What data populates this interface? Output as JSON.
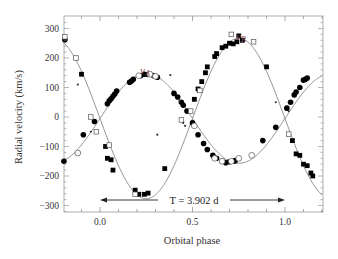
{
  "chart_data": {
    "type": "scatter",
    "title": "",
    "xlabel": "Orbital phase",
    "ylabel": "Radial velocity (km/s)",
    "xlim": [
      -0.195,
      1.2
    ],
    "ylim": [
      -320,
      330
    ],
    "xticks": [
      0.0,
      0.5,
      1.0
    ],
    "xtick_labels": [
      "0.0",
      "0.5",
      "1.0"
    ],
    "yticks": [
      300,
      200,
      100,
      0,
      -100,
      -200,
      -300
    ],
    "ytick_labels": [
      "300",
      "200",
      "100",
      "0",
      "−100",
      "−200",
      "−300"
    ],
    "grid": false,
    "legend": null,
    "annotations": [
      {
        "text": "v_A",
        "x": 0.25,
        "y": 165
      },
      {
        "text": "v_B",
        "x": 0.68,
        "y": 290
      },
      {
        "text": "T = 3.902 d",
        "type": "double-arrow",
        "x_from": 0.0,
        "x_to": 1.0,
        "y": -280
      }
    ],
    "model_curves": [
      {
        "name": "v_A",
        "gamma": -5,
        "K": 152,
        "phase_of_max": 0.25,
        "style": "solid gray line"
      },
      {
        "name": "v_B",
        "gamma": -5,
        "K": 272,
        "phase_of_max": 0.75,
        "style": "solid gray line"
      }
    ],
    "series": [
      {
        "name": "v_A (filled circles)",
        "marker": "filled-circle",
        "points": [
          [
            -0.195,
            -150
          ],
          [
            -0.19,
            262
          ],
          [
            -0.09,
            -60
          ],
          [
            -0.03,
            -15
          ],
          [
            0.04,
            45
          ],
          [
            0.05,
            55
          ],
          [
            0.06,
            62
          ],
          [
            0.07,
            70
          ],
          [
            0.08,
            78
          ],
          [
            0.09,
            88
          ],
          [
            0.16,
            118
          ],
          [
            0.17,
            122
          ],
          [
            0.18,
            128
          ],
          [
            0.22,
            140
          ],
          [
            0.24,
            145
          ],
          [
            0.26,
            144
          ],
          [
            0.29,
            140
          ],
          [
            0.31,
            135
          ],
          [
            0.4,
            80
          ],
          [
            0.42,
            68
          ],
          [
            0.44,
            50
          ],
          [
            0.45,
            40
          ],
          [
            0.47,
            20
          ],
          [
            0.5,
            -20
          ],
          [
            0.53,
            -60
          ],
          [
            0.56,
            -90
          ],
          [
            0.58,
            -110
          ],
          [
            0.61,
            -130
          ],
          [
            0.63,
            -140
          ],
          [
            0.66,
            -150
          ],
          [
            0.68,
            -155
          ],
          [
            0.7,
            -152
          ],
          [
            0.72,
            -150
          ],
          [
            0.73,
            -148
          ],
          [
            0.88,
            -80
          ],
          [
            0.95,
            -35
          ],
          [
            1.01,
            30
          ],
          [
            1.03,
            50
          ],
          [
            1.05,
            75
          ],
          [
            1.06,
            85
          ],
          [
            1.08,
            100
          ],
          [
            1.1,
            125
          ],
          [
            1.11,
            128
          ],
          [
            1.12,
            132
          ]
        ]
      },
      {
        "name": "v_A (open circles)",
        "marker": "open-circle",
        "points": [
          [
            -0.12,
            -122
          ],
          [
            0.21,
            140
          ],
          [
            0.27,
            145
          ],
          [
            0.3,
            138
          ],
          [
            0.51,
            -30
          ],
          [
            0.62,
            -140
          ],
          [
            0.66,
            -150
          ],
          [
            0.71,
            -150
          ],
          [
            0.75,
            -140
          ],
          [
            0.82,
            -130
          ]
        ]
      },
      {
        "name": "v_B (filled squares)",
        "marker": "filled-square",
        "points": [
          [
            -0.1,
            145
          ],
          [
            0.03,
            -100
          ],
          [
            0.04,
            -140
          ],
          [
            0.06,
            -145
          ],
          [
            0.07,
            -180
          ],
          [
            0.19,
            -248
          ],
          [
            0.21,
            -262
          ],
          [
            0.24,
            -262
          ],
          [
            0.26,
            -258
          ],
          [
            0.35,
            -175
          ],
          [
            0.51,
            60
          ],
          [
            0.53,
            95
          ],
          [
            0.55,
            120
          ],
          [
            0.57,
            150
          ],
          [
            0.58,
            170
          ],
          [
            0.62,
            205
          ],
          [
            0.63,
            215
          ],
          [
            0.66,
            235
          ],
          [
            0.68,
            240
          ],
          [
            0.7,
            250
          ],
          [
            0.72,
            248
          ],
          [
            0.74,
            255
          ],
          [
            0.75,
            275
          ],
          [
            0.77,
            260
          ],
          [
            0.9,
            170
          ],
          [
            1.04,
            -80
          ],
          [
            1.06,
            -125
          ],
          [
            1.08,
            -130
          ],
          [
            1.1,
            -160
          ],
          [
            1.12,
            -165
          ],
          [
            1.14,
            -190
          ],
          [
            1.15,
            -200
          ]
        ]
      },
      {
        "name": "v_B (open squares)",
        "marker": "open-square",
        "points": [
          [
            -0.19,
            272
          ],
          [
            -0.13,
            200
          ],
          [
            -0.05,
            0
          ],
          [
            -0.02,
            -50
          ],
          [
            0.05,
            -95
          ],
          [
            0.19,
            -262
          ],
          [
            0.44,
            -10
          ],
          [
            0.49,
            20
          ],
          [
            0.54,
            90
          ],
          [
            0.71,
            280
          ],
          [
            0.83,
            255
          ],
          [
            1.02,
            -58
          ]
        ]
      },
      {
        "name": "small dots / blended",
        "marker": "small-dot",
        "points": [
          [
            -0.12,
            110
          ],
          [
            -0.05,
            -50
          ],
          [
            0.31,
            -60
          ],
          [
            0.38,
            142
          ],
          [
            0.43,
            55
          ],
          [
            0.45,
            -20
          ],
          [
            0.46,
            -30
          ],
          [
            0.95,
            50
          ],
          [
            1.02,
            20
          ]
        ]
      }
    ]
  },
  "labels": {
    "xlabel": "Orbital phase",
    "ylabel": "Radial velocity (km/s)",
    "vA": "v",
    "vA_sub": "A",
    "vB": "v",
    "vB_sub": "B",
    "period": "T = 3.902 d"
  }
}
